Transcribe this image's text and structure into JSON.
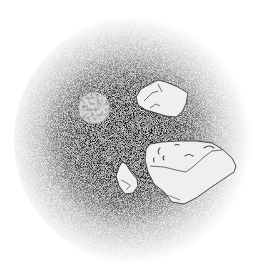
{
  "scene": {
    "description": "Stippled ink illustration of asteroids and a small cratered moon floating in a dark circular patch of space",
    "background_color": "#ffffff",
    "halo": {
      "cx": 138,
      "cy": 140,
      "r": 122,
      "core_color": "#1a1a1a",
      "edge_color": "#ffffff"
    },
    "moon": {
      "cx": 94,
      "cy": 108,
      "r": 16,
      "fill": "#d8d8d8",
      "label": "cratered moon"
    },
    "rocks": [
      {
        "name": "upper-right-asteroid",
        "label": "asteroid"
      },
      {
        "name": "large-lower-right-asteroid",
        "label": "large asteroid"
      },
      {
        "name": "small-lower-asteroid",
        "label": "small asteroid"
      }
    ],
    "debris": [
      {
        "cx": 137,
        "cy": 119,
        "r": 2.2
      },
      {
        "cx": 146,
        "cy": 123,
        "r": 1.6
      },
      {
        "cx": 115,
        "cy": 131,
        "r": 1.8
      }
    ],
    "rock_fill": "#efefef",
    "outline_color": "#3a3a3a"
  }
}
